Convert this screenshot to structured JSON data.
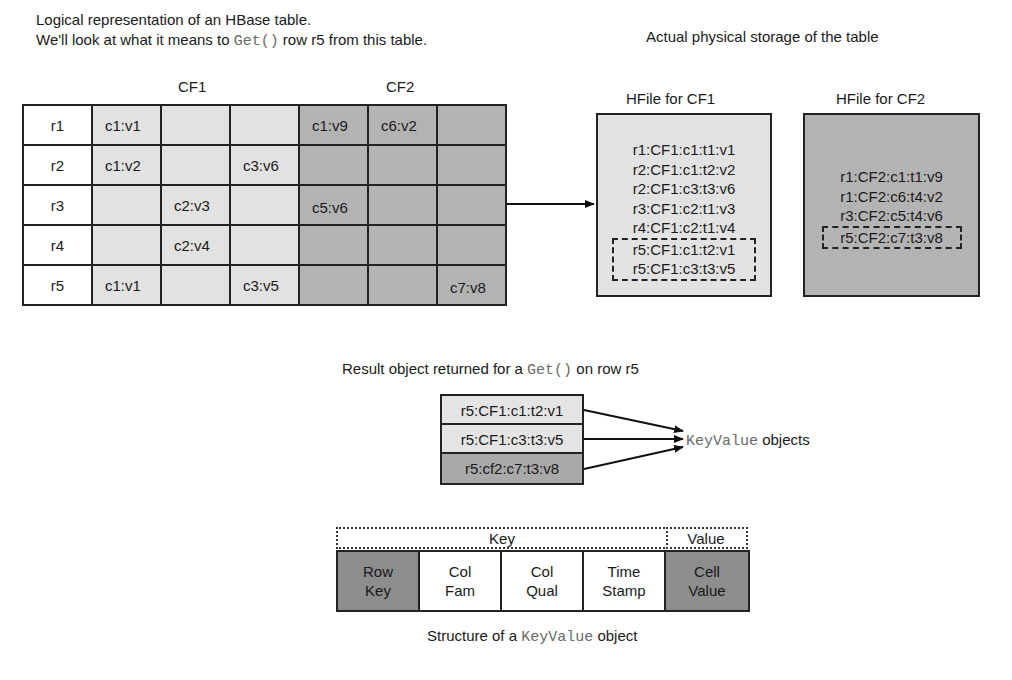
{
  "logical": {
    "title_line1": "Logical representation of an HBase table.",
    "title_line2_pre": "We'll look at what it means to ",
    "title_line2_code": "Get()",
    "title_line2_post": " row r5 from this table.",
    "cf1_label": "CF1",
    "cf2_label": "CF2",
    "rows": [
      {
        "key": "r1",
        "cells": [
          "c1:v1",
          "",
          "",
          "c1:v9",
          "c6:v2",
          ""
        ]
      },
      {
        "key": "r2",
        "cells": [
          "c1:v2",
          "",
          "c3:v6",
          "",
          "",
          ""
        ]
      },
      {
        "key": "r3",
        "cells": [
          "",
          "c2:v3",
          "",
          "c5:v6",
          "",
          ""
        ]
      },
      {
        "key": "r4",
        "cells": [
          "",
          "c2:v4",
          "",
          "",
          "",
          ""
        ]
      },
      {
        "key": "r5",
        "cells": [
          "c1:v1",
          "",
          "c3:v5",
          "",
          "",
          "c7:v8"
        ]
      }
    ]
  },
  "physical": {
    "title": "Actual physical storage of the table",
    "hfile_cf1": {
      "title": "HFile for CF1",
      "lines": [
        "r1:CF1:c1:t1:v1",
        "r2:CF1:c1:t2:v2",
        "r2:CF1:c3:t3:v6",
        "r3:CF1:c2:t1:v3",
        "r4:CF1:c2:t1:v4"
      ],
      "highlighted": [
        "r5:CF1:c1:t2:v1",
        "r5:CF1:c3:t3:v5"
      ]
    },
    "hfile_cf2": {
      "title": "HFile for CF2",
      "lines": [
        "r1:CF2:c1:t1:v9",
        "r1:CF2:c6:t4:v2",
        "r3:CF2:c5:t4:v6"
      ],
      "highlighted": [
        "r5:CF2:c7:t3:v8"
      ]
    }
  },
  "result": {
    "caption_pre": "Result object returned for a ",
    "caption_code": "Get()",
    "caption_post": " on row r5",
    "items": [
      "r5:CF1:c1:t2:v1",
      "r5:CF1:c3:t3:v5",
      "r5:cf2:c7:t3:v8"
    ],
    "pointer_code": "KeyValue",
    "pointer_post": " objects"
  },
  "keyvalue": {
    "key_label": "Key",
    "value_label": "Value",
    "cells": [
      {
        "line1": "Row",
        "line2": "Key"
      },
      {
        "line1": "Col",
        "line2": "Fam"
      },
      {
        "line1": "Col",
        "line2": "Qual"
      },
      {
        "line1": "Time",
        "line2": "Stamp"
      },
      {
        "line1": "Cell",
        "line2": "Value"
      }
    ],
    "caption_pre": "Structure of a ",
    "caption_code": "KeyValue",
    "caption_post": " object"
  },
  "colors": {
    "cf1_fill": "#e2e2e2",
    "cf2_fill": "#b3b3b3",
    "dark_fill": "#8d8d8d",
    "line": "#222222"
  }
}
